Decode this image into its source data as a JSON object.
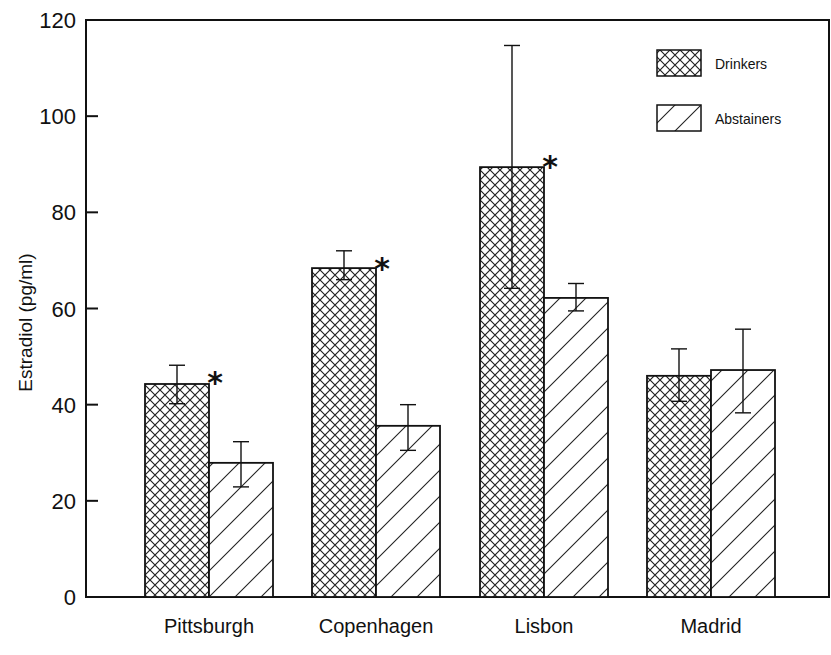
{
  "chart_data": {
    "type": "bar",
    "title": "",
    "xlabel": "",
    "ylabel": "Estradiol (pg/ml)",
    "ylim": [
      0,
      120
    ],
    "yticks": [
      0,
      20,
      40,
      60,
      80,
      100,
      120
    ],
    "grid": false,
    "legend_position": "top-right",
    "categories": [
      "Pittsburgh",
      "Copenhagen",
      "Lisbon",
      "Madrid"
    ],
    "series": [
      {
        "name": "Drinkers",
        "pattern": "crosshatch",
        "values": [
          44.3,
          68.4,
          89.4,
          46.0
        ],
        "error_low": [
          40.2,
          66.0,
          64.2,
          40.7
        ],
        "error_high": [
          48.2,
          72.0,
          114.7,
          51.6
        ]
      },
      {
        "name": "Abstainers",
        "pattern": "diagonal",
        "values": [
          27.9,
          35.6,
          62.2,
          47.2
        ],
        "error_low": [
          22.9,
          30.5,
          59.5,
          38.3
        ],
        "error_high": [
          32.3,
          40.0,
          65.2,
          55.7
        ]
      }
    ],
    "annotations": [
      {
        "category": "Pittsburgh",
        "text": "*"
      },
      {
        "category": "Copenhagen",
        "text": "*"
      },
      {
        "category": "Lisbon",
        "text": "*"
      }
    ],
    "colors": {
      "line": "#111111",
      "background": "#ffffff"
    }
  }
}
